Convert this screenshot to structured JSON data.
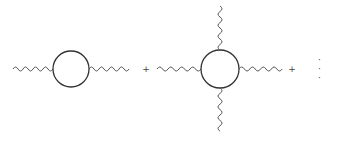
{
  "diagram": {
    "type": "feynman-series",
    "terms": [
      {
        "name": "two-point-loop",
        "external_legs": 2
      },
      {
        "name": "four-point-loop",
        "external_legs": 4
      }
    ],
    "operators": [
      "+",
      "+"
    ],
    "ellipsis": "· · ·",
    "colors": {
      "line": "#333333",
      "wavy": "#555555",
      "background": "#ffffff"
    }
  }
}
